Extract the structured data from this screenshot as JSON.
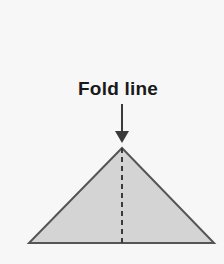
{
  "figure": {
    "name": "fold-line-triangle-diagram",
    "canvas": {
      "width": 224,
      "height": 264,
      "background_color": "#f7f7f7"
    },
    "label": {
      "text": "Fold line",
      "color": "#1a1a1a",
      "font_size_px": 19,
      "center_x": 118,
      "baseline_y": 95
    },
    "arrow": {
      "icon_name": "down-arrow-icon",
      "color": "#3a3a3a",
      "shaft_x": 122,
      "shaft_top_y": 104,
      "shaft_bottom_y": 133,
      "shaft_width_px": 2,
      "head_top_y": 131,
      "head_tip_y": 143,
      "head_half_width_px": 7,
      "direction": "down"
    },
    "triangle": {
      "shape_name": "isosceles-triangle",
      "fill_color": "#d4d4d4",
      "stroke_color": "#555555",
      "stroke_width_px": 2,
      "apex_x": 122,
      "apex_y": 148,
      "bottom_left_x": 29,
      "bottom_left_y": 243,
      "bottom_right_x": 214,
      "bottom_right_y": 243
    },
    "fold_line": {
      "line_name": "fold-line-dashed",
      "color": "#3a3a3a",
      "x": 122,
      "top_y": 148,
      "bottom_y": 243,
      "stroke_width_px": 2,
      "dash_length_px": 5,
      "gap_length_px": 4,
      "style": "dashed"
    }
  }
}
